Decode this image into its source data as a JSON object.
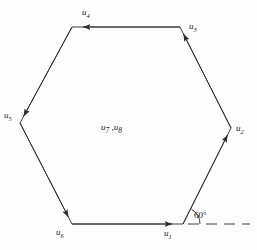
{
  "figure": {
    "type": "vector-polygon-diagram",
    "shape": "regular-hexagon",
    "background_color": "#fdfdfd",
    "stroke_color": "#2b2b2b"
  },
  "labels": {
    "u1": {
      "base": "u",
      "sub": "1"
    },
    "u2": {
      "base": "u",
      "sub": "2"
    },
    "u3": {
      "base": "u",
      "sub": "3"
    },
    "u4": {
      "base": "u",
      "sub": "4"
    },
    "u5": {
      "base": "u",
      "sub": "5"
    },
    "u6": {
      "base": "u",
      "sub": "6"
    },
    "u7": {
      "base": "u",
      "sub": "7"
    },
    "u8": {
      "base": "u",
      "sub": "8"
    },
    "center_separator": " ,",
    "angle": "60°"
  },
  "geometry": {
    "vertices": [
      {
        "name": "bottom-right",
        "x": 183,
        "y": 224
      },
      {
        "name": "right",
        "x": 231,
        "y": 128
      },
      {
        "name": "top-right",
        "x": 180,
        "y": 27
      },
      {
        "name": "top-left",
        "x": 72,
        "y": 27
      },
      {
        "name": "left",
        "x": 20,
        "y": 123
      },
      {
        "name": "bottom-left",
        "x": 72,
        "y": 224
      }
    ],
    "reference_line": {
      "name": "horizontal-dashed-reference",
      "x1": 188,
      "y1": 224,
      "x2": 250,
      "y2": 224,
      "style": "dashed"
    },
    "angle_arc": {
      "vertex_x": 183,
      "vertex_y": 224,
      "radius": 17,
      "value_degrees": 60
    }
  }
}
